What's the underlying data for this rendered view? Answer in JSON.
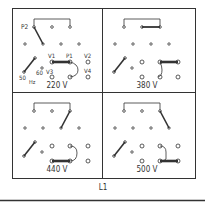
{
  "diagram": {
    "bottom_label": "L1",
    "line_color": "#333333",
    "panels": [
      {
        "id": "220",
        "voltage_label": "220 V",
        "terminal_labels": {
          "p2": "P2",
          "v1": "V1",
          "p1": "P1",
          "v2": "V2",
          "v3": "V3",
          "v4": "V4",
          "hz50": "50",
          "hz60": "60",
          "hz": "Hz"
        }
      },
      {
        "id": "380",
        "voltage_label": "380 V"
      },
      {
        "id": "440",
        "voltage_label": "440 V"
      },
      {
        "id": "500",
        "voltage_label": "500 V"
      }
    ]
  }
}
